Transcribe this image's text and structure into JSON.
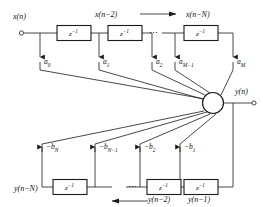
{
  "diagram": {
    "type": "signal-flow-diagram",
    "colors": {
      "line": "#1a1a1a",
      "text": "#111111",
      "background": "#ffffff",
      "box_fill": "#ffffff"
    },
    "signals": {
      "input": "x(n)",
      "output": "y(n)",
      "forward_taps": [
        "x(n−2)",
        "x(n−N)"
      ],
      "feedback_taps": [
        "y(n−N)",
        "y(n−2)",
        "y(n−1)"
      ]
    },
    "delay_label": "z",
    "delay_exponent": "−1",
    "ellipsis": "⋯",
    "top_delays": [
      {
        "name": "delay-x1",
        "label": "z",
        "exp": "−1"
      },
      {
        "name": "delay-x2",
        "label": "z",
        "exp": "−1"
      },
      {
        "name": "delay-xN",
        "label": "z",
        "exp": "−1"
      }
    ],
    "bottom_delays": [
      {
        "name": "delay-yN",
        "label": "z",
        "exp": "−1"
      },
      {
        "name": "delay-y2",
        "label": "z",
        "exp": "−1"
      },
      {
        "name": "delay-y1",
        "label": "z",
        "exp": "−1"
      }
    ],
    "feedforward_coefficients": [
      {
        "id": "a0",
        "base": "a",
        "sub": "0"
      },
      {
        "id": "a1",
        "base": "a",
        "sub": "1"
      },
      {
        "id": "a2",
        "base": "a",
        "sub": "2"
      },
      {
        "id": "aM1",
        "base": "a",
        "sub": "M−1"
      },
      {
        "id": "aM",
        "base": "a",
        "sub": "M"
      }
    ],
    "feedback_coefficients": [
      {
        "id": "bN",
        "base": "−b",
        "sub": "N"
      },
      {
        "id": "bN1",
        "base": "−b",
        "sub": "N−1"
      },
      {
        "id": "b2",
        "base": "−b",
        "sub": "2"
      },
      {
        "id": "b1",
        "base": "−b",
        "sub": "1"
      }
    ],
    "summing_junction": {
      "name": "summing-junction"
    },
    "flow_arrows": {
      "top": "rightward",
      "bottom": "leftward"
    }
  }
}
